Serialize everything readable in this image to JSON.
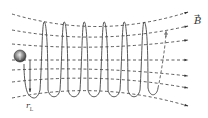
{
  "diagram": {
    "type": "helical-particle-motion-in-converging-magnetic-field",
    "field_label": "B",
    "field_label_vector_arrow": "→",
    "radius_label": "r",
    "radius_label_subscript": "L",
    "colors": {
      "line": "#333333",
      "particle_fill": "#777777",
      "particle_highlight": "#dddddd"
    },
    "field_line_count": 7,
    "helix_loop_count": 6
  }
}
